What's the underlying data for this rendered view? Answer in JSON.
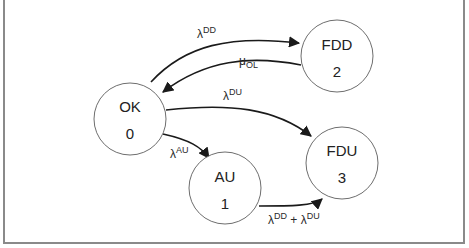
{
  "diagram": {
    "type": "state-transition (Markov) diagram",
    "nodes": [
      {
        "id": "OK",
        "name": "OK",
        "index": "0"
      },
      {
        "id": "AU",
        "name": "AU",
        "index": "1"
      },
      {
        "id": "FDD",
        "name": "FDD",
        "index": "2"
      },
      {
        "id": "FDU",
        "name": "FDU",
        "index": "3"
      }
    ],
    "edges": [
      {
        "from": "OK",
        "to": "FDD",
        "label": {
          "base": "λ",
          "sup": "DD",
          "sub": ""
        }
      },
      {
        "from": "FDD",
        "to": "OK",
        "label": {
          "base": "μ",
          "sup": "",
          "sub": "OL"
        }
      },
      {
        "from": "OK",
        "to": "FDU",
        "label": {
          "base": "λ",
          "sup": "DU",
          "sub": ""
        }
      },
      {
        "from": "OK",
        "to": "AU",
        "label": {
          "base": "λ",
          "sup": "AU",
          "sub": ""
        }
      },
      {
        "from": "AU",
        "to": "FDU",
        "label": {
          "base": "λ",
          "sup": "DD",
          "plus": " + ",
          "base2": "λ",
          "sup2": "DU"
        }
      }
    ],
    "colors": {
      "stroke": "#1a1a1a",
      "circle": "#6e6e6e",
      "frame": "#8a8a8a",
      "background": "#ffffff"
    }
  }
}
